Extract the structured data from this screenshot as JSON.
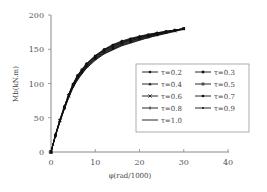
{
  "chart_data": {
    "type": "line",
    "title": "",
    "xlabel": "φ(rad/1000)",
    "ylabel": "Mb(kN.m)",
    "xlim": [
      0,
      40
    ],
    "ylim": [
      0,
      200
    ],
    "x_ticks": [
      0,
      10,
      20,
      30,
      40
    ],
    "y_ticks": [
      0,
      50,
      100,
      150,
      200
    ],
    "grid": false,
    "legend_position": "right-center inside plot, 2 columns",
    "x": [
      0,
      1,
      2,
      3,
      4,
      5,
      6,
      7,
      8,
      10,
      12,
      14,
      16,
      18,
      20,
      22,
      24,
      26,
      28,
      30
    ],
    "series": [
      {
        "name": "τ=0.2",
        "marker": "diamond",
        "values": [
          0,
          25,
          47,
          66,
          84,
          100,
          112,
          121,
          129,
          141,
          150,
          157,
          162,
          166,
          169,
          172,
          174,
          176,
          178,
          180
        ]
      },
      {
        "name": "τ=0.3",
        "marker": "square",
        "values": [
          0,
          25,
          47,
          66,
          84,
          99,
          111,
          120,
          128,
          140,
          149,
          156,
          161,
          165,
          168,
          171,
          174,
          176,
          178,
          180
        ]
      },
      {
        "name": "τ=0.4",
        "marker": "triangle",
        "values": [
          0,
          25,
          46,
          66,
          83,
          99,
          111,
          120,
          128,
          140,
          149,
          155,
          160,
          165,
          168,
          171,
          173,
          176,
          178,
          180
        ]
      },
      {
        "name": "τ=0.5",
        "marker": "double-cross",
        "values": [
          0,
          24,
          46,
          65,
          83,
          98,
          110,
          119,
          127,
          139,
          148,
          154,
          160,
          164,
          167,
          170,
          173,
          175,
          178,
          180
        ]
      },
      {
        "name": "τ=0.6",
        "marker": "x",
        "values": [
          0,
          24,
          46,
          65,
          82,
          98,
          109,
          118,
          126,
          138,
          147,
          153,
          159,
          163,
          166,
          170,
          172,
          175,
          177,
          180
        ]
      },
      {
        "name": "τ=0.7",
        "marker": "circle",
        "values": [
          0,
          24,
          45,
          64,
          82,
          97,
          108,
          117,
          125,
          137,
          146,
          152,
          158,
          162,
          166,
          169,
          172,
          175,
          177,
          180
        ]
      },
      {
        "name": "τ=0.8",
        "marker": "plus",
        "values": [
          0,
          24,
          45,
          64,
          81,
          96,
          107,
          116,
          124,
          136,
          145,
          151,
          157,
          161,
          165,
          168,
          171,
          174,
          177,
          180
        ]
      },
      {
        "name": "τ=0.9",
        "marker": "dash",
        "values": [
          0,
          23,
          44,
          63,
          80,
          95,
          106,
          115,
          123,
          135,
          144,
          150,
          156,
          160,
          164,
          167,
          171,
          174,
          177,
          180
        ]
      },
      {
        "name": "τ=1.0",
        "marker": "none",
        "values": [
          0,
          23,
          44,
          62,
          79,
          94,
          105,
          114,
          122,
          134,
          143,
          149,
          155,
          159,
          163,
          167,
          170,
          173,
          176,
          179
        ]
      }
    ]
  },
  "axes": {
    "x_label": "φ(rad/1000)",
    "y_label": "Mb(kN.m)",
    "x_tick_labels": [
      "0",
      "10",
      "20",
      "30",
      "40"
    ],
    "y_tick_labels": [
      "0",
      "50",
      "100",
      "150",
      "200"
    ]
  },
  "legend": {
    "items": [
      {
        "label": "τ=0.2",
        "marker": "diamond"
      },
      {
        "label": "τ=0.3",
        "marker": "square"
      },
      {
        "label": "τ=0.4",
        "marker": "triangle"
      },
      {
        "label": "τ=0.5",
        "marker": "double-cross"
      },
      {
        "label": "τ=0.6",
        "marker": "x"
      },
      {
        "label": "τ=0.7",
        "marker": "circle"
      },
      {
        "label": "τ=0.8",
        "marker": "plus"
      },
      {
        "label": "τ=0.9",
        "marker": "dash"
      },
      {
        "label": "τ=1.0",
        "marker": "none"
      }
    ]
  },
  "colors": {
    "line": "#111111",
    "axis": "#888888",
    "legend_border": "#999999"
  }
}
